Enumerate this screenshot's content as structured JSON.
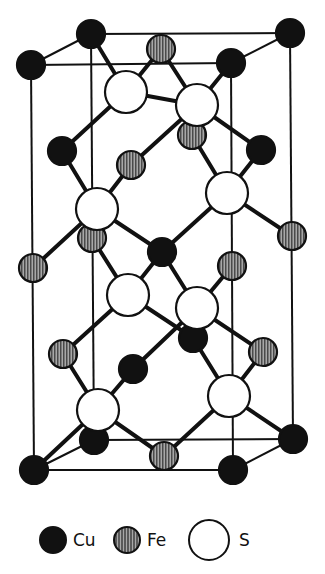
{
  "colors": {
    "cu_fill": "#111111",
    "fe_fill": "#8a8a8a",
    "s_fill": "#ffffff",
    "stroke": "#111111"
  },
  "radii": {
    "Cu": 14,
    "Fe": 14,
    "S": 21
  },
  "cell_edges": [
    [
      91,
      34,
      290,
      33
    ],
    [
      31,
      65,
      231,
      63
    ],
    [
      91,
      34,
      31,
      65
    ],
    [
      290,
      33,
      231,
      63
    ],
    [
      31,
      65,
      34,
      470
    ],
    [
      231,
      63,
      233,
      470
    ],
    [
      91,
      34,
      94,
      440
    ],
    [
      290,
      33,
      293,
      439
    ],
    [
      34,
      470,
      233,
      470
    ],
    [
      94,
      440,
      293,
      439
    ],
    [
      94,
      440,
      34,
      470
    ],
    [
      293,
      439,
      233,
      470
    ]
  ],
  "bonds": [
    [
      91,
      34,
      126,
      92
    ],
    [
      161,
      49,
      126,
      92
    ],
    [
      126,
      92,
      62,
      151
    ],
    [
      126,
      92,
      197,
      105
    ],
    [
      231,
      63,
      197,
      105
    ],
    [
      161,
      49,
      197,
      105
    ],
    [
      197,
      105,
      131,
      165
    ],
    [
      197,
      105,
      261,
      150
    ],
    [
      62,
      151,
      97,
      209
    ],
    [
      131,
      165,
      97,
      209
    ],
    [
      97,
      209,
      33,
      268
    ],
    [
      97,
      209,
      162,
      252
    ],
    [
      192,
      135,
      227,
      193
    ],
    [
      261,
      150,
      227,
      193
    ],
    [
      227,
      193,
      162,
      252
    ],
    [
      227,
      193,
      292,
      236
    ],
    [
      92,
      238,
      128,
      295
    ],
    [
      162,
      252,
      128,
      295
    ],
    [
      128,
      295,
      63,
      354
    ],
    [
      128,
      295,
      193,
      338
    ],
    [
      162,
      252,
      197,
      308
    ],
    [
      232,
      266,
      197,
      308
    ],
    [
      197,
      308,
      133,
      369
    ],
    [
      197,
      308,
      263,
      352
    ],
    [
      63,
      354,
      98,
      410
    ],
    [
      133,
      369,
      98,
      410
    ],
    [
      98,
      410,
      34,
      470
    ],
    [
      98,
      410,
      164,
      456
    ],
    [
      193,
      338,
      229,
      396
    ],
    [
      263,
      352,
      229,
      396
    ],
    [
      229,
      396,
      164,
      456
    ],
    [
      229,
      396,
      293,
      439
    ]
  ],
  "atoms": [
    {
      "el": "Cu",
      "x": 91,
      "y": 34
    },
    {
      "el": "Cu",
      "x": 290,
      "y": 33
    },
    {
      "el": "Fe",
      "x": 161,
      "y": 49
    },
    {
      "el": "Cu",
      "x": 31,
      "y": 65
    },
    {
      "el": "Cu",
      "x": 231,
      "y": 63
    },
    {
      "el": "Fe",
      "x": 192,
      "y": 135
    },
    {
      "el": "S",
      "x": 126,
      "y": 92
    },
    {
      "el": "S",
      "x": 197,
      "y": 105
    },
    {
      "el": "Cu",
      "x": 62,
      "y": 151
    },
    {
      "el": "Fe",
      "x": 131,
      "y": 165
    },
    {
      "el": "Cu",
      "x": 261,
      "y": 150
    },
    {
      "el": "Fe",
      "x": 92,
      "y": 238
    },
    {
      "el": "S",
      "x": 97,
      "y": 209
    },
    {
      "el": "S",
      "x": 227,
      "y": 193
    },
    {
      "el": "Fe",
      "x": 292,
      "y": 236
    },
    {
      "el": "Cu",
      "x": 162,
      "y": 252
    },
    {
      "el": "Fe",
      "x": 33,
      "y": 268
    },
    {
      "el": "Fe",
      "x": 232,
      "y": 266
    },
    {
      "el": "Cu",
      "x": 193,
      "y": 338
    },
    {
      "el": "S",
      "x": 128,
      "y": 295
    },
    {
      "el": "S",
      "x": 197,
      "y": 308
    },
    {
      "el": "Fe",
      "x": 63,
      "y": 354
    },
    {
      "el": "Cu",
      "x": 133,
      "y": 369
    },
    {
      "el": "Fe",
      "x": 263,
      "y": 352
    },
    {
      "el": "Cu",
      "x": 94,
      "y": 440
    },
    {
      "el": "Cu",
      "x": 293,
      "y": 439
    },
    {
      "el": "S",
      "x": 98,
      "y": 410
    },
    {
      "el": "S",
      "x": 229,
      "y": 396
    },
    {
      "el": "Fe",
      "x": 164,
      "y": 456
    },
    {
      "el": "Cu",
      "x": 34,
      "y": 470
    },
    {
      "el": "Cu",
      "x": 233,
      "y": 470
    }
  ],
  "legend": {
    "items": [
      {
        "element": "Cu",
        "label": "Cu"
      },
      {
        "element": "Fe",
        "label": "Fe"
      },
      {
        "element": "S",
        "label": "S"
      }
    ]
  }
}
